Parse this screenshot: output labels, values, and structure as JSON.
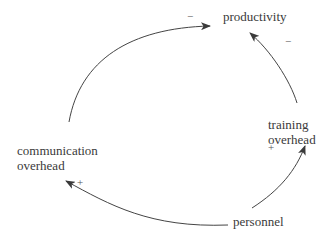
{
  "nodes": {
    "productivity": "productivity",
    "training_line1": "training",
    "training_line2": "overhead",
    "comm_line1": "communication",
    "comm_line2": "overhead",
    "personnel": "personnel"
  },
  "links": {
    "comm_to_productivity": "−",
    "training_to_productivity": "−",
    "personnel_to_training": "+",
    "personnel_to_comm": "+"
  },
  "colors": {
    "line": "#444444",
    "text": "#3a3a3a"
  }
}
